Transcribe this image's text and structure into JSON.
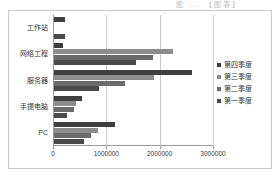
{
  "top_caption": "图 ...  【图表】",
  "chart_data": {
    "type": "bar",
    "orientation": "horizontal",
    "title": "",
    "subtitle": "",
    "xlabel": "",
    "ylabel": "",
    "categories": [
      "工作站",
      "网络工程",
      "服务器",
      "手提电脑",
      "PC"
    ],
    "series": [
      {
        "name": "第四季度",
        "color": "#3f3f3f",
        "values": [
          200000,
          170000,
          2580000,
          520000,
          1150000
        ]
      },
      {
        "name": "第三季度",
        "color": "#8c8c8c",
        "values": [
          0,
          2230000,
          1880000,
          420000,
          830000
        ]
      },
      {
        "name": "第二季度",
        "color": "#6b6b6b",
        "values": [
          0,
          1850000,
          1330000,
          370000,
          690000
        ]
      },
      {
        "name": "第一季度",
        "color": "#4a4a4a",
        "values": [
          200000,
          1530000,
          840000,
          240000,
          560000
        ]
      }
    ],
    "xlim": [
      0,
      3000000
    ],
    "xticks": [
      0,
      1000000,
      2000000,
      3000000
    ],
    "xtick_labels": [
      "0",
      "1000000",
      "2000000",
      "3000000"
    ],
    "grid": "vertical",
    "legend_position": "right",
    "legend_entries": [
      "第四季度",
      "第三季度",
      "第二季度",
      "第一季度"
    ],
    "plot_background": "#ffffff",
    "frame_color": "#c8c8c8",
    "gridline_color": "#c9c9c9"
  }
}
